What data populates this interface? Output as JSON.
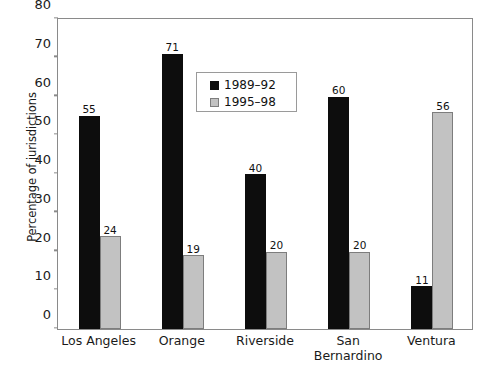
{
  "chart_data": {
    "type": "bar",
    "title": "",
    "xlabel": "",
    "ylabel": "Percentage of jurisdictions",
    "ylim": [
      0,
      80
    ],
    "yticks": [
      0,
      10,
      20,
      30,
      40,
      50,
      60,
      70,
      80
    ],
    "grid": false,
    "legend_position": "inside-upper-center",
    "categories": [
      "Los Angeles",
      "Orange",
      "Riverside",
      "San\nBernardino",
      "Ventura"
    ],
    "series": [
      {
        "name": "1989–92",
        "color": "#0d0d0d",
        "values": [
          55,
          71,
          40,
          60,
          11
        ]
      },
      {
        "name": "1995–98",
        "color": "#c2c2c2",
        "values": [
          24,
          19,
          20,
          20,
          56
        ]
      }
    ]
  },
  "axis": {
    "y_title": "Percentage of jurisdictions",
    "y_tick_labels": [
      "0",
      "10",
      "20",
      "30",
      "40",
      "50",
      "60",
      "70",
      "80"
    ]
  },
  "legend": {
    "entries": [
      {
        "label": "1989–92"
      },
      {
        "label": "1995–98"
      }
    ]
  }
}
